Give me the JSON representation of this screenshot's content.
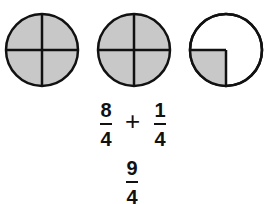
{
  "diagram": {
    "circles": [
      {
        "parts": 4,
        "shaded": 4
      },
      {
        "parts": 4,
        "shaded": 4
      },
      {
        "parts": 4,
        "shaded": 1
      }
    ],
    "fill_color": "#c8c8c8",
    "equation": {
      "term1": {
        "numerator": "8",
        "denominator": "4"
      },
      "operator": "+",
      "term2": {
        "numerator": "1",
        "denominator": "4"
      }
    },
    "result": {
      "numerator": "9",
      "denominator": "4"
    }
  }
}
